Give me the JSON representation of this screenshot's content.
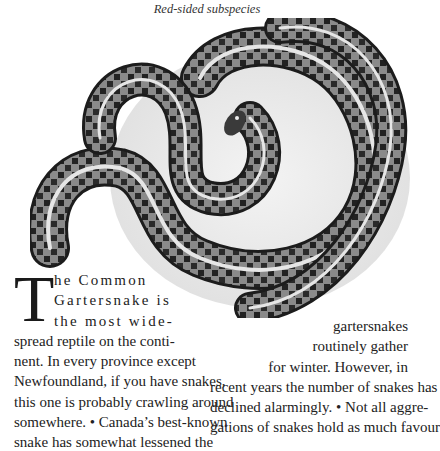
{
  "figure": {
    "caption": "Red-sided subspecies",
    "illustration": "snake-illustration",
    "illustration_description": "Pencil drawing of a coiled Common Gartersnake with checkered dark blotches and pale stripes"
  },
  "article": {
    "drop_cap": "T",
    "left_column_lines": [
      "he Common",
      "Gartersnake is",
      "the most wide-",
      "spread reptile on the conti-",
      "nent. In every province except",
      "Newfoundland, if you have snakes,",
      "this one is probably crawling around",
      "somewhere. • Canada’s best-known",
      "snake has somewhat lessened the"
    ],
    "right_column_lines": [
      "gartersnakes",
      "routinely gather",
      "for winter. However, in",
      "recent years the number of snakes has",
      "declined alarmingly. • Not all aggre-",
      "gations of snakes hold as much favour"
    ]
  }
}
